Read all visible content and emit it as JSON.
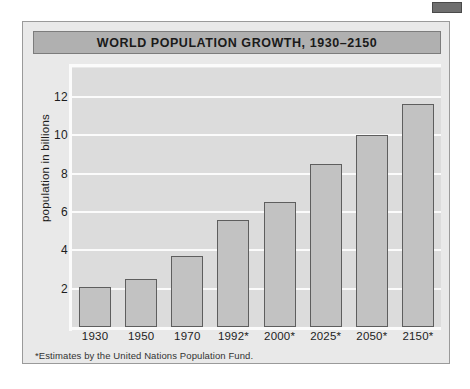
{
  "figure": {
    "title": "WORLD POPULATION GROWTH, 1930–2150",
    "footnote": "*Estimates by the United Nations Population Fund.",
    "corner_tab": "corner-tab-mark",
    "colors": {
      "panel_background": "#e9e9e9",
      "plot_background": "#dcdcdc",
      "title_bar": "#b0b0b0",
      "bar_fill": "#c2c2c2",
      "bar_stroke": "#5e5e5e",
      "gridline": "#fbfbfb",
      "text": "#1a1a1a"
    }
  },
  "chart_data": {
    "type": "bar",
    "title": "WORLD POPULATION GROWTH, 1930–2150",
    "xlabel": "",
    "ylabel": "population in billions",
    "categories": [
      "1930",
      "1950",
      "1970",
      "1992*",
      "2000*",
      "2025*",
      "2050*",
      "2150*"
    ],
    "values": [
      2.1,
      2.5,
      3.7,
      5.6,
      6.5,
      8.5,
      10.0,
      11.6
    ],
    "ylim": [
      0,
      13.5
    ],
    "yticks": [
      2,
      4,
      6,
      8,
      10,
      12
    ],
    "ytick_labels": [
      "2",
      "4",
      "6",
      "8",
      "10",
      "12"
    ],
    "grid": true,
    "grid_axis": "y",
    "legend": false,
    "annotations": [
      "*Estimates by the United Nations Population Fund."
    ]
  }
}
